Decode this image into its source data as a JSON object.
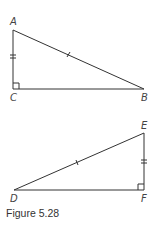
{
  "figure": {
    "caption": "Figure 5.28",
    "line_color": "#333333"
  },
  "triangle_abc": {
    "vertices": {
      "A": {
        "label": "A",
        "x": 13,
        "y": 30
      },
      "B": {
        "label": "B",
        "x": 144,
        "y": 89
      },
      "C": {
        "label": "C",
        "x": 13,
        "y": 89
      }
    },
    "right_angle_at": "C",
    "marks": {
      "hypotenuse_AB": "single-tick",
      "leg_AC": "double-tick"
    }
  },
  "triangle_def": {
    "vertices": {
      "D": {
        "label": "D",
        "x": 14,
        "y": 190
      },
      "E": {
        "label": "E",
        "x": 144,
        "y": 133
      },
      "F": {
        "label": "F",
        "x": 144,
        "y": 190
      }
    },
    "right_angle_at": "F",
    "marks": {
      "hypotenuse_DE": "single-tick",
      "leg_EF": "double-tick"
    }
  }
}
